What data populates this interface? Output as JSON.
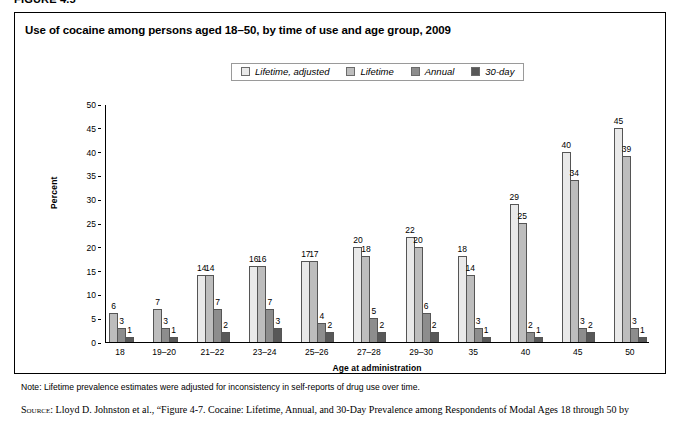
{
  "figure": {
    "number": "FIGURE 4.5"
  },
  "chart_title": "Use of cocaine among persons aged 18–50, by time of use and age group, 2009",
  "notes": {
    "note_label": "Note:",
    "note_text": " Lifetime prevalence estimates were adjusted for inconsistency in self-reports of drug use over time.",
    "source_label": "Source:",
    "source_text": " Lloyd D. Johnston et al., “Figure 4-7. Cocaine: Lifetime, Annual, and 30-Day Prevalence among Respondents of Modal Ages 18 through 50 by"
  },
  "colors": {
    "series_lifetime_adjusted": "#e9e9e9",
    "series_lifetime": "#bdbdbd",
    "series_annual": "#8d8d8d",
    "series_30day": "#585858",
    "axis": "#000000",
    "legend_border": "#9a9a9a"
  },
  "chart_data": {
    "type": "bar",
    "title": "Use of cocaine among persons aged 18–50, by time of use and age group, 2009",
    "xlabel": "Age at administration",
    "ylabel": "Percent",
    "ylim": [
      0,
      50
    ],
    "yticks": [
      0,
      5,
      10,
      15,
      20,
      25,
      30,
      35,
      40,
      45,
      50
    ],
    "grid": false,
    "legend_position": "top-center",
    "categories": [
      "18",
      "19–20",
      "21–22",
      "23–24",
      "25–26",
      "27–28",
      "29–30",
      "35",
      "40",
      "45",
      "50"
    ],
    "series": [
      {
        "name": "Lifetime, adjusted",
        "color": "#e9e9e9",
        "values": [
          null,
          null,
          14,
          16,
          17,
          20,
          22,
          18,
          29,
          40,
          45
        ]
      },
      {
        "name": "Lifetime",
        "color": "#bdbdbd",
        "values": [
          6,
          7,
          14,
          16,
          17,
          18,
          20,
          14,
          25,
          34,
          39
        ]
      },
      {
        "name": "Annual",
        "color": "#8d8d8d",
        "values": [
          3,
          3,
          7,
          7,
          4,
          5,
          6,
          3,
          2,
          3,
          3
        ]
      },
      {
        "name": "30-day",
        "color": "#585858",
        "values": [
          1,
          1,
          2,
          3,
          2,
          2,
          2,
          1,
          1,
          2,
          1
        ]
      }
    ]
  }
}
